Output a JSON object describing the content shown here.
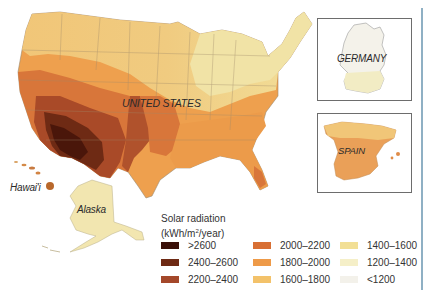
{
  "map": {
    "title": "Solar radiation",
    "unit_prefix": "(kWh/m",
    "unit_sup": "2",
    "unit_suffix": "/year)",
    "regions": {
      "us": "UNITED STATES",
      "hawaii": "Hawai'i",
      "alaska": "Alaska",
      "germany": "GERMANY",
      "spain": "SPAIN"
    }
  },
  "legend": {
    "items": [
      {
        "label": ">2600",
        "color": "#3a1008"
      },
      {
        "label": "2400–2600",
        "color": "#6e2a14"
      },
      {
        "label": "2200–2400",
        "color": "#a4482a"
      },
      {
        "label": "2000–2200",
        "color": "#d86f34"
      },
      {
        "label": "1800–2000",
        "color": "#ee9a48"
      },
      {
        "label": "1600–1800",
        "color": "#f3c26a"
      },
      {
        "label": "1400–1600",
        "color": "#f2df95"
      },
      {
        "label": "1200–1400",
        "color": "#f5efc8"
      },
      {
        "label": "<1200",
        "color": "#f3f1ea"
      }
    ]
  }
}
